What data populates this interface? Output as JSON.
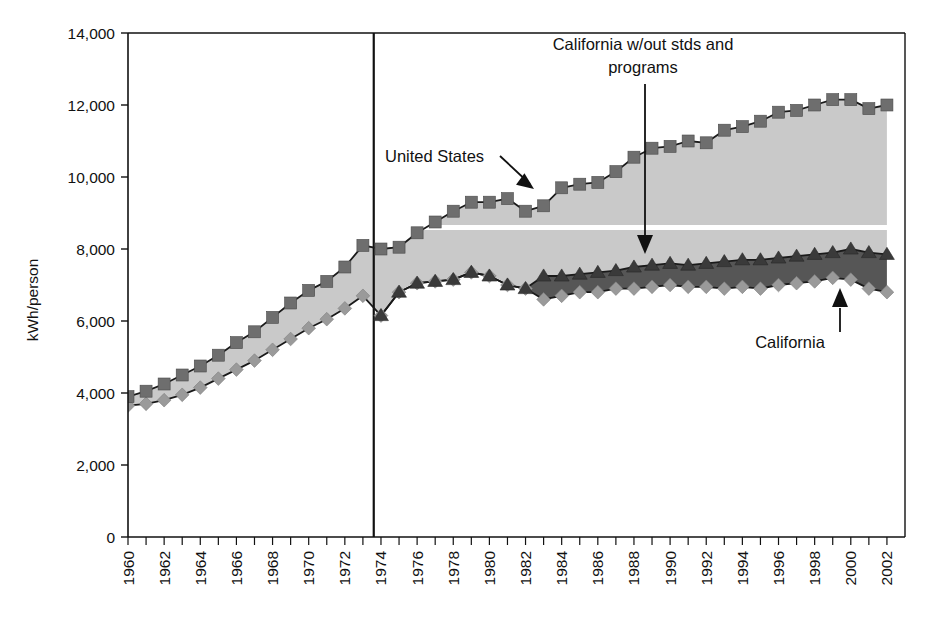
{
  "chart_data": {
    "type": "line",
    "title": "",
    "subtitle": "",
    "xlabel": "",
    "ylabel": "kWh/person",
    "xlim": [
      1960,
      2003
    ],
    "ylim": [
      0,
      14000
    ],
    "ytick_step": 2000,
    "grid": false,
    "legend_position": "none",
    "marker_shapes": {
      "united_states": "square",
      "california_wout_stds_and_programs": "triangle",
      "california": "diamond"
    },
    "colors": {
      "united_states_marker": "#6e6e6e",
      "united_states_fill": "#c9c9c9",
      "cal_wout_marker": "#3a3a3a",
      "cal_wout_fill": "#565656",
      "california_marker": "#9a9a9a",
      "line": "#1a1a1a",
      "axis": "#111111",
      "background": "#ffffff",
      "white_band": "#ffffff"
    },
    "yticks": [
      0,
      2000,
      4000,
      6000,
      8000,
      10000,
      12000,
      14000
    ],
    "ytick_labels": [
      "0",
      "2,000",
      "4,000",
      "6,000",
      "8,000",
      "10,000",
      "12,000",
      "14,000"
    ],
    "xticks": [
      1960,
      1961,
      1962,
      1963,
      1964,
      1965,
      1966,
      1967,
      1968,
      1969,
      1970,
      1971,
      1972,
      1973,
      1974,
      1975,
      1976,
      1977,
      1978,
      1979,
      1980,
      1981,
      1982,
      1983,
      1984,
      1985,
      1986,
      1987,
      1988,
      1989,
      1990,
      1991,
      1992,
      1993,
      1994,
      1995,
      1996,
      1997,
      1998,
      1999,
      2000,
      2001,
      2002
    ],
    "xtick_labels": [
      "1960",
      "1962",
      "1964",
      "1966",
      "1968",
      "1970",
      "1972",
      "1974",
      "1976",
      "1978",
      "1980",
      "1982",
      "1984",
      "1986",
      "1988",
      "1990",
      "1992",
      "1994",
      "1996",
      "1998",
      "2000",
      "2002"
    ],
    "xtick_label_years": [
      1960,
      1962,
      1964,
      1966,
      1968,
      1970,
      1972,
      1974,
      1976,
      1978,
      1980,
      1982,
      1984,
      1986,
      1988,
      1990,
      1992,
      1994,
      1996,
      1998,
      2000,
      2002
    ],
    "x": [
      1960,
      1961,
      1962,
      1963,
      1964,
      1965,
      1966,
      1967,
      1968,
      1969,
      1970,
      1971,
      1972,
      1973,
      1974,
      1975,
      1976,
      1977,
      1978,
      1979,
      1980,
      1981,
      1982,
      1983,
      1984,
      1985,
      1986,
      1987,
      1988,
      1989,
      1990,
      1991,
      1992,
      1993,
      1994,
      1995,
      1996,
      1997,
      1998,
      1999,
      2000,
      2001,
      2002
    ],
    "series": [
      {
        "name": "United States",
        "marker": "square",
        "values": [
          3900,
          4050,
          4250,
          4500,
          4750,
          5050,
          5400,
          5700,
          6100,
          6500,
          6850,
          7100,
          7500,
          8100,
          8000,
          8050,
          8450,
          8750,
          9050,
          9300,
          9300,
          9400,
          9050,
          9200,
          9700,
          9800,
          9850,
          10150,
          10550,
          10800,
          10850,
          11000,
          10950,
          11300,
          11400,
          11550,
          11800,
          11850,
          12000,
          12150,
          12150,
          11900,
          12000
        ]
      },
      {
        "name": "California w/out stds and programs",
        "marker": "triangle",
        "values": [
          null,
          null,
          null,
          null,
          null,
          null,
          null,
          null,
          null,
          null,
          null,
          null,
          null,
          null,
          6150,
          6800,
          7050,
          7100,
          7150,
          7350,
          7250,
          7000,
          6900,
          7250,
          7250,
          7300,
          7350,
          7400,
          7500,
          7550,
          7600,
          7550,
          7600,
          7650,
          7700,
          7700,
          7750,
          7800,
          7850,
          7900,
          8000,
          7900,
          7850
        ]
      },
      {
        "name": "California",
        "marker": "diamond",
        "values": [
          3650,
          3700,
          3800,
          3950,
          4150,
          4400,
          4650,
          4900,
          5200,
          5500,
          5800,
          6050,
          6350,
          6700,
          6150,
          6800,
          7050,
          7100,
          7150,
          7350,
          7250,
          7000,
          6900,
          6600,
          6700,
          6800,
          6800,
          6900,
          6900,
          6950,
          7000,
          6950,
          6950,
          6900,
          6950,
          6900,
          7000,
          7050,
          7100,
          7200,
          7150,
          6900,
          6800
        ]
      }
    ],
    "annotations": [
      {
        "id": "united-states",
        "text": "United States",
        "target_x": 1981,
        "target_y": 9450,
        "arrow": "down-right"
      },
      {
        "id": "california-wout-stds",
        "text_line1": "California w/out stds and",
        "text_line2": "programs",
        "target_x": 1989,
        "target_y": 7900,
        "arrow": "down"
      },
      {
        "id": "california",
        "text": "California",
        "target_x": 2000,
        "target_y": 7250,
        "arrow": "up"
      }
    ],
    "vertical_marker_line": {
      "x": 1973.6,
      "label": ""
    },
    "white_separator_band": {
      "y": 8600,
      "note": "white band drawn across the light-gray United States fill"
    }
  }
}
